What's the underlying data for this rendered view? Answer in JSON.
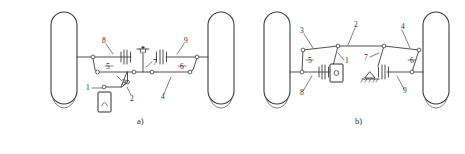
{
  "figure": {
    "type": "technical-schematic",
    "background_color": "#ffffff",
    "line_color": "#3c3c3c",
    "text_color": "#2a2a2a"
  },
  "diagrams": [
    {
      "id": "a",
      "caption": "a)",
      "labels": [
        {
          "key": "a1",
          "text": "1"
        },
        {
          "key": "a2",
          "text": "2"
        },
        {
          "key": "a3",
          "text": "3"
        },
        {
          "key": "a4",
          "text": "4"
        },
        {
          "key": "a5",
          "text": "5"
        },
        {
          "key": "a6",
          "text": "6"
        },
        {
          "key": "a7",
          "text": "7"
        },
        {
          "key": "a8",
          "text": "8"
        },
        {
          "key": "a9",
          "text": "9"
        }
      ]
    },
    {
      "id": "b",
      "caption": "b)",
      "labels": [
        {
          "key": "b1",
          "text": "1"
        },
        {
          "key": "b2",
          "text": "2"
        },
        {
          "key": "b3",
          "text": "3"
        },
        {
          "key": "b4",
          "text": "4"
        },
        {
          "key": "b5",
          "text": "5"
        },
        {
          "key": "b6",
          "text": "6"
        },
        {
          "key": "b7",
          "text": "7"
        },
        {
          "key": "b8",
          "text": "8"
        },
        {
          "key": "b9",
          "text": "9"
        }
      ]
    }
  ]
}
